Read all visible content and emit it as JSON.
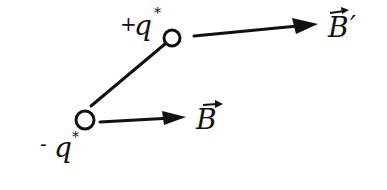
{
  "diagram": {
    "colors": {
      "ink": "#111111",
      "background": "#ffffff"
    },
    "charges": [
      {
        "id": "positive",
        "sign": "+",
        "symbol": "q",
        "superscript": "*"
      },
      {
        "id": "negative",
        "sign": "-",
        "symbol": "q",
        "superscript": "*"
      }
    ],
    "fields": [
      {
        "id": "B_prime",
        "symbol": "B",
        "prime": "′",
        "vector": true
      },
      {
        "id": "B",
        "symbol": "B",
        "prime": "",
        "vector": true
      }
    ]
  }
}
